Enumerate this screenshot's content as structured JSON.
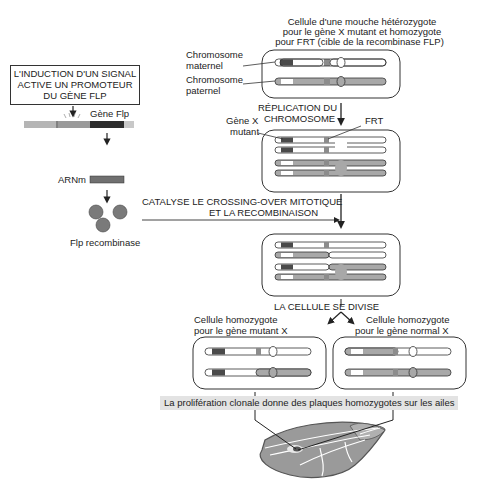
{
  "top_caption": {
    "line1": "Cellule d'une mouche hétérozygote",
    "line2": "pour le gène X mutant et homozygote",
    "line3": "pour FRT (cible de la recombinase FLP)"
  },
  "labels": {
    "chrom_maternel_1": "Chromosome",
    "chrom_maternel_2": "maternel",
    "chrom_paternel_1": "Chromosome",
    "chrom_paternel_2": "paternel",
    "gene_x_1": "Gène X",
    "gene_x_2": "mutant",
    "frt": "FRT"
  },
  "steps": {
    "replication_1": "RÉPLICATION DU",
    "replication_2": "CHROMOSOME",
    "crossing_1": "CATALYSE LE CROSSING-OVER MITOTIQUE",
    "crossing_2": "ET LA RECOMBINAISON",
    "division": "LA CELLULE SE DIVISE"
  },
  "induction_box": {
    "line1": "L'INDUCTION D'UN SIGNAL",
    "line2": "ACTIVE UN PROMOTEUR",
    "line3": "DU GÈNE FLP"
  },
  "flp": {
    "gene_label": "Gène Flp",
    "mrna_label": "ARNm",
    "protein_label": "Flp recombinase"
  },
  "daughters": {
    "left_1": "Cellule homozygote",
    "left_2": "pour le gène mutant X",
    "right_1": "Cellule homozygote",
    "right_2": "pour le gène normal X"
  },
  "banner": "La prolifération clonale donne des plaques homozygotes sur les ailes",
  "colors": {
    "mutant_band": "#4a4a4a",
    "paternal_fill": "#a8a8a8",
    "frt_band": "#8c8c8c",
    "banner_bg": "#e3e3e3",
    "wing_fill": "#9a9a9a"
  }
}
